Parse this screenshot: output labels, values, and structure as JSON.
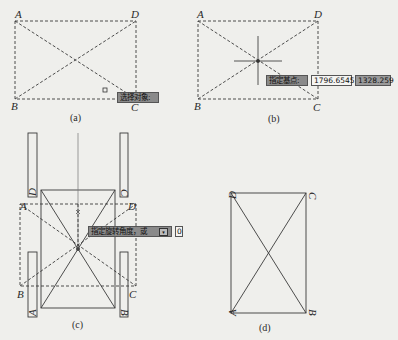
{
  "panels": {
    "a": {
      "caption": "(a)",
      "vertices": {
        "A": "A",
        "B": "B",
        "C": "C",
        "D": "D"
      },
      "tooltip": "选择对象:"
    },
    "b": {
      "caption": "(b)",
      "vertices": {
        "A": "A",
        "B": "B",
        "C": "C",
        "D": "D"
      },
      "tooltip": {
        "prompt": "指定基点:",
        "x_value": "1796.6545",
        "y_value": "1328.259"
      }
    },
    "c": {
      "caption": "(c)",
      "vertices": {
        "A": "A",
        "B": "B",
        "C": "C",
        "D": "D"
      },
      "side_labels": {
        "top_left": "D",
        "top_right": "C",
        "bottom_left": "A",
        "bottom_right": "B"
      },
      "tooltip": {
        "prompt": "指定旋转角度，或",
        "option_icon": "dropdown-arrow-icon",
        "value": "0"
      }
    },
    "d": {
      "caption": "(d)",
      "vertices": {
        "A": "A",
        "B": "B",
        "C": "C",
        "D": "D"
      }
    }
  },
  "colors": {
    "background": "#efefec",
    "line": "#3a3a3a",
    "tooltip_dark": "#8a8a8a",
    "tooltip_light": "#f4f4f2"
  }
}
